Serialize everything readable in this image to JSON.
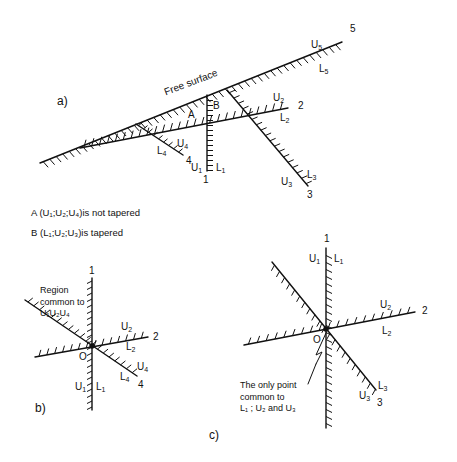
{
  "diagram": {
    "colors": {
      "line": "#111111",
      "background": "#ffffff"
    },
    "panel_a": {
      "label": "a)",
      "free_surface_label": "Free surface",
      "region_A": "A",
      "region_B": "B",
      "lines": {
        "1": {
          "number": "1",
          "upper": "U",
          "upper_sub": "1",
          "lower": "L",
          "lower_sub": "1"
        },
        "2": {
          "number": "2",
          "upper": "U",
          "upper_sub": "2",
          "lower": "L",
          "lower_sub": "2"
        },
        "3": {
          "number": "3",
          "upper": "U",
          "upper_sub": "3",
          "lower": "L",
          "lower_sub": "3"
        },
        "4": {
          "number": "4",
          "upper": "U",
          "upper_sub": "4",
          "lower": "L",
          "lower_sub": "4"
        },
        "5": {
          "number": "5",
          "upper": "U",
          "upper_sub": "5",
          "lower": "L",
          "lower_sub": "5"
        }
      }
    },
    "captions": {
      "A": "A (U₁;U₂;U₄)is not tapered",
      "B": "B (L₁;U₂;U₃)is tapered"
    },
    "panel_b": {
      "label": "b)",
      "origin": "O",
      "region_note_line1": "Region",
      "region_note_line2": "common to",
      "region_note_line3": "U₁U₂U₄",
      "lines": {
        "1": {
          "number": "1",
          "upper": "U",
          "upper_sub": "1",
          "lower": "L",
          "lower_sub": "1"
        },
        "2": {
          "number": "2",
          "upper": "U",
          "upper_sub": "2",
          "lower": "L",
          "lower_sub": "2"
        },
        "4": {
          "number": "4",
          "upper": "U",
          "upper_sub": "4",
          "lower": "L",
          "lower_sub": "4"
        }
      }
    },
    "panel_c": {
      "label": "c)",
      "origin": "O",
      "note_line1": "The only point",
      "note_line2": "common to",
      "note_line3": "L₁ ; U₂ and U₃",
      "lines": {
        "1": {
          "number": "1",
          "upper": "U",
          "upper_sub": "1",
          "lower": "L",
          "lower_sub": "1"
        },
        "2": {
          "number": "2",
          "upper": "U",
          "upper_sub": "2",
          "lower": "L",
          "lower_sub": "2"
        },
        "3": {
          "number": "3",
          "upper": "U",
          "upper_sub": "3",
          "lower": "L",
          "lower_sub": "3"
        }
      }
    }
  }
}
